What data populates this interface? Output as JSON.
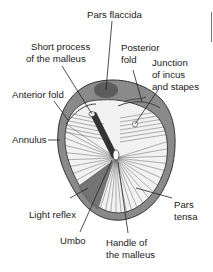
{
  "diagram": {
    "labels": {
      "pars_flaccida": "Pars flaccida",
      "short_process_1": "Short process",
      "short_process_2": "of the malleus",
      "posterior_fold_1": "Posterior",
      "posterior_fold_2": "fold",
      "junction_1": "Junction",
      "junction_2": "of incus",
      "junction_3": "and stapes",
      "anterior_fold": "Anterior fold",
      "annulus": "Annulus",
      "light_reflex": "Light reflex",
      "umbo": "Umbo",
      "handle_1": "Handle of",
      "handle_2": "the malleus",
      "pars_tensa_1": "Pars",
      "pars_tensa_2": "tensa"
    },
    "colors": {
      "annulus": "#8a8a8a",
      "pars_flaccida": "#6e6e6e",
      "membrane": "#f2f2f2",
      "fibers": "#555555",
      "light_reflex": "#707070",
      "text": "#1a1a1a"
    }
  }
}
